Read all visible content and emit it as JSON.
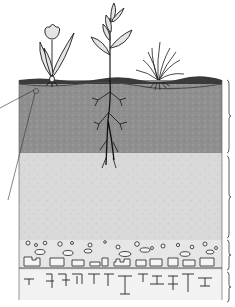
{
  "diagram": {
    "type": "soil-profile-cross-section",
    "labels_visible": false,
    "colors": {
      "background": "#ffffff",
      "topsoil": "#8f8f8f",
      "topsoil_surface": "#3a3a3a",
      "subsoil": "#d9d9d9",
      "weathered_rock": "#e6e6e6",
      "bedrock": "#f2f2f2",
      "line": "#1a1a1a",
      "leaf_fill": "#e4e4e4"
    },
    "plants": [
      {
        "name": "tulip",
        "x": 52
      },
      {
        "name": "leafy-sapling",
        "x": 110
      },
      {
        "name": "grass-tuft",
        "x": 160
      }
    ],
    "layers": [
      {
        "name": "topsoil",
        "y_top": 80,
        "y_bottom": 153
      },
      {
        "name": "subsoil",
        "y_top": 153,
        "y_bottom": 240
      },
      {
        "name": "weathered-rock",
        "y_top": 240,
        "y_bottom": 270
      },
      {
        "name": "bedrock",
        "y_top": 270,
        "y_bottom": 300
      }
    ],
    "braces": [
      {
        "layer": "topsoil",
        "y_top": 80,
        "y_bottom": 153
      },
      {
        "layer": "subsoil",
        "y_top": 156,
        "y_bottom": 238
      },
      {
        "layer": "weathered-rock",
        "y_top": 240,
        "y_bottom": 270
      },
      {
        "layer": "bedrock",
        "y_top": 272,
        "y_bottom": 302
      }
    ],
    "callout": {
      "name": "topsoil-sample-circle",
      "x": 36,
      "y": 91
    }
  }
}
